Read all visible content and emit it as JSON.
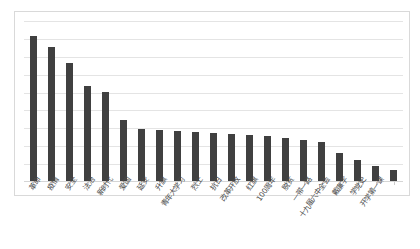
{
  "chart_data": {
    "type": "bar",
    "title": "",
    "subtitle": "",
    "xlabel": "",
    "ylabel": "",
    "grid": true,
    "legend": false,
    "gridline_count": 9,
    "ylim": [
      0,
      9
    ],
    "bar_color": "#404040",
    "gridline_color": "#e4e4e4",
    "border_color": "#d9d9d9",
    "categories": [
      "革命",
      "疫情",
      "安全",
      "法治",
      "新时代",
      "爱国",
      "延安",
      "升旗",
      "青年大学习",
      "烈士",
      "抗日",
      "改革开放",
      "红旗",
      "100周年",
      "脱贫",
      "一带一路",
      "十九届六中全会",
      "戴廉字",
      "学党史",
      "开学第一课"
    ],
    "values": [
      8.1,
      7.5,
      6.6,
      5.3,
      5.0,
      3.4,
      2.9,
      2.85,
      2.8,
      2.75,
      2.7,
      2.65,
      2.6,
      2.5,
      2.4,
      2.3,
      2.2,
      1.55,
      1.15,
      0.85
    ],
    "extra_value": 0.6,
    "bar_count": 21
  }
}
